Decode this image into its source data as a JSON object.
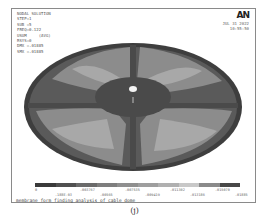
{
  "header": {
    "info_lines": [
      "NODAL SOLUTION",
      "",
      "STEP=1",
      "SUB =5",
      "FREQ=0.122",
      "USUM     (AVG)",
      "RSYS=0",
      "DMX =.01885",
      "SMX =.01885"
    ],
    "logo": "AN",
    "date": "JUL 31 2022",
    "time": "10:55:50"
  },
  "legend": {
    "colors": [
      "#3a3a3a",
      "#505050",
      "#6a6a6a",
      "#7e7e7e",
      "#8f8f8f",
      "#9e9e9e",
      "#b0b0b0",
      "#c8c8c8",
      "#8a8a8a",
      "#484848"
    ],
    "ticks_top": [
      "0",
      ".003767",
      ".007535",
      ".011302",
      ".015070"
    ],
    "ticks_bottom": [
      ".188E-03",
      ".00565",
      ".009419",
      ".013186",
      ".01885"
    ]
  },
  "caption": "membrane form finding analysis of cable dome",
  "figure_label": "(j)"
}
